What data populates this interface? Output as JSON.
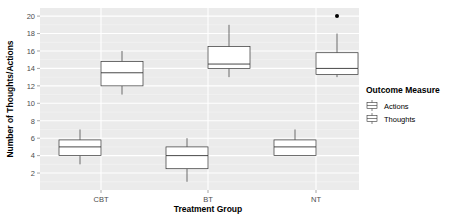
{
  "chart_data": {
    "type": "boxplot",
    "title": "",
    "xlabel": "Treatment Group",
    "ylabel": "Number of Thoughts/Actions",
    "categories": [
      "CBT",
      "BT",
      "NT"
    ],
    "yticks": [
      2,
      4,
      6,
      8,
      10,
      12,
      14,
      16,
      18,
      20
    ],
    "ylim": [
      0,
      21
    ],
    "legend": {
      "title": "Outcome Measure",
      "entries": [
        "Actions",
        "Thoughts"
      ],
      "position": "right"
    },
    "series": [
      {
        "name": "Actions",
        "boxes": [
          {
            "min": 3,
            "q1": 4,
            "median": 5,
            "q3": 5.8,
            "max": 7,
            "outliers": []
          },
          {
            "min": 1,
            "q1": 2.5,
            "median": 4,
            "q3": 5,
            "max": 6,
            "outliers": []
          },
          {
            "min": 4,
            "q1": 4,
            "median": 5,
            "q3": 5.8,
            "max": 7,
            "outliers": []
          }
        ]
      },
      {
        "name": "Thoughts",
        "boxes": [
          {
            "min": 11,
            "q1": 12,
            "median": 13.5,
            "q3": 14.8,
            "max": 16,
            "outliers": []
          },
          {
            "min": 13,
            "q1": 14,
            "median": 14.5,
            "q3": 16.5,
            "max": 19,
            "outliers": []
          },
          {
            "min": 13,
            "q1": 13.3,
            "median": 14,
            "q3": 15.8,
            "max": 18,
            "outliers": [
              20
            ]
          }
        ]
      }
    ],
    "grid": true
  }
}
